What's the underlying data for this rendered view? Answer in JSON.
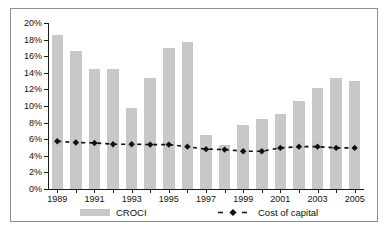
{
  "chart_data": {
    "type": "bar",
    "title": "",
    "xlabel": "",
    "ylabel": "",
    "ylim": [
      0,
      20
    ],
    "ytick_values": [
      0,
      2,
      4,
      6,
      8,
      10,
      12,
      14,
      16,
      18,
      20
    ],
    "ytick_labels": [
      "0%",
      "2%",
      "4%",
      "6%",
      "8%",
      "10%",
      "12%",
      "14%",
      "16%",
      "18%",
      "20%"
    ],
    "categories": [
      "1989",
      "1990",
      "1991",
      "1992",
      "1993",
      "1994",
      "1995",
      "1996",
      "1997",
      "1998",
      "1999",
      "2000",
      "2001",
      "2002",
      "2003",
      "2004",
      "2005"
    ],
    "xtick_labels_shown": [
      "1989",
      "1991",
      "1993",
      "1995",
      "1997",
      "1999",
      "2001",
      "2003",
      "2005"
    ],
    "grid": false,
    "legend_position": "bottom",
    "series": [
      {
        "name": "CROCI",
        "render": "bar",
        "color": "#c8c8c8",
        "values": [
          18.6,
          16.6,
          14.5,
          14.4,
          9.8,
          13.4,
          17.0,
          17.7,
          6.5,
          5.3,
          7.7,
          8.4,
          9.0,
          10.6,
          12.2,
          13.4,
          13.0
        ]
      },
      {
        "name": "Cost of capital",
        "render": "line-dashed-marker",
        "color": "#111111",
        "marker": "diamond",
        "values": [
          5.75,
          5.6,
          5.55,
          5.4,
          5.4,
          5.35,
          5.35,
          5.1,
          4.8,
          4.75,
          4.55,
          4.55,
          4.95,
          5.1,
          5.1,
          4.95,
          4.95
        ]
      }
    ]
  },
  "legend": {
    "croci_label": "CROCI",
    "cost_of_capital_label": "Cost of capital"
  }
}
